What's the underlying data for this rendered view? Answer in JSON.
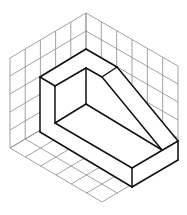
{
  "figure": {
    "colors": {
      "background": "#ffffff",
      "grid": "#8a8a8a",
      "object_edges": "#111111"
    },
    "grid": {
      "left_wall_cells": [
        5,
        5
      ],
      "right_wall_cells": [
        6,
        5
      ],
      "floor_cells": [
        5,
        6
      ]
    },
    "object_points": {
      "outer_top": [
        86,
        49
      ],
      "outer_left_top": [
        40,
        77
      ],
      "outer_left_bottom": [
        40,
        132
      ],
      "inner_left_top": [
        55,
        86
      ],
      "inner_left_bottom": [
        55,
        123
      ],
      "inner_back_top": [
        86,
        68
      ],
      "inner_back_bottom": [
        86,
        104
      ],
      "rib_outer_top": [
        117,
        67
      ],
      "rib_inner_top": [
        102,
        77
      ],
      "rib_inner_bottom": [
        162,
        150
      ],
      "front_right_top": [
        178,
        141
      ],
      "front_right_bottom": [
        178,
        160
      ],
      "front_top": [
        132,
        168
      ],
      "front_bottom": [
        132,
        187
      ]
    }
  }
}
